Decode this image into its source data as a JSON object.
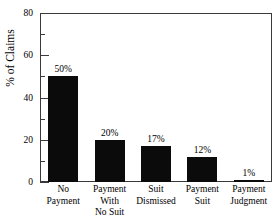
{
  "chart_data": {
    "type": "bar",
    "title": "",
    "xlabel": "",
    "ylabel": "% of Claims",
    "ylim": [
      0,
      80
    ],
    "yticks": [
      0,
      20,
      40,
      60,
      80
    ],
    "ytick_labels": [
      "0",
      "20",
      "40",
      "60",
      "80"
    ],
    "minor_yticks": [
      10,
      30,
      50,
      70
    ],
    "grid": false,
    "legend": null,
    "bar_color": "#0b0b0b",
    "axis_color": "#3a3a3a",
    "categories": [
      "No Payment",
      "Payment With No Suit",
      "Suit Dismissed",
      "Payment Suit",
      "Payment Judgment"
    ],
    "category_lines": [
      [
        "No",
        "Payment"
      ],
      [
        "Payment",
        "With",
        "No Suit"
      ],
      [
        "Suit",
        "Dismissed"
      ],
      [
        "Payment",
        "Suit"
      ],
      [
        "Payment",
        "Judgment"
      ]
    ],
    "values": [
      50,
      20,
      17,
      12,
      1
    ],
    "data_labels": [
      "50%",
      "20%",
      "17%",
      "12%",
      "1%"
    ]
  }
}
